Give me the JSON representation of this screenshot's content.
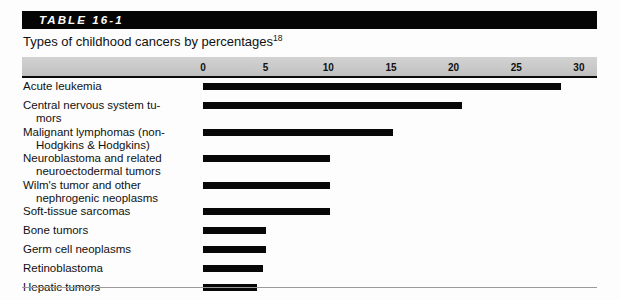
{
  "table": {
    "label": "TABLE 16-1",
    "caption": "Types of childhood cancers by percentages",
    "caption_superscript": "18"
  },
  "colors": {
    "title_bar_background": "#050505",
    "title_text": "#ffffff",
    "axis_band_background": "#c9c9c9",
    "bar_fill": "#070707",
    "rule": "#9a9a9a",
    "page_background": "#fdfdfd"
  },
  "chart_data": {
    "type": "bar",
    "orientation": "horizontal",
    "title": "Types of childhood cancers by percentages",
    "xlabel": "",
    "ylabel": "",
    "xlim": [
      0,
      30
    ],
    "xticks": [
      0,
      5,
      10,
      15,
      20,
      25,
      30
    ],
    "xtick_labels": [
      "0",
      "5",
      "10",
      "15",
      "20",
      "25",
      "30"
    ],
    "grid": false,
    "legend": false,
    "categories": [
      "Acute leukemia",
      "Central nervous system tumors",
      "Malignant lymphomas (non-Hodgkins & Hodgkins)",
      "Neuroblastoma and related neuroectodermal tumors",
      "Wilm's tumor and other nephrogenic neoplasms",
      "Soft-tissue sarcomas",
      "Bone tumors",
      "Germ cell neoplasms",
      "Retinoblastoma",
      "Hepatic tumors"
    ],
    "values": [
      28.6,
      20.7,
      15.2,
      10.1,
      10.1,
      10.1,
      5.0,
      5.0,
      4.8,
      4.3
    ]
  },
  "rows": [
    {
      "line1": "Acute leukemia",
      "line2": "",
      "value": 28.6
    },
    {
      "line1": "Central nervous system tu-",
      "line2": "mors",
      "value": 20.7
    },
    {
      "line1": "Malignant lymphomas (non-",
      "line2": "Hodgkins & Hodgkins)",
      "value": 15.2
    },
    {
      "line1": "Neuroblastoma and related",
      "line2": "neuroectodermal tumors",
      "value": 10.1
    },
    {
      "line1": "Wilm's tumor and other",
      "line2": "nephrogenic neoplasms",
      "value": 10.1
    },
    {
      "line1": "Soft-tissue sarcomas",
      "line2": "",
      "value": 10.1
    },
    {
      "line1": "Bone tumors",
      "line2": "",
      "value": 5.0
    },
    {
      "line1": "Germ cell neoplasms",
      "line2": "",
      "value": 5.0
    },
    {
      "line1": "Retinoblastoma",
      "line2": "",
      "value": 4.8
    },
    {
      "line1": "Hepatic tumors",
      "line2": "",
      "value": 4.3
    }
  ]
}
